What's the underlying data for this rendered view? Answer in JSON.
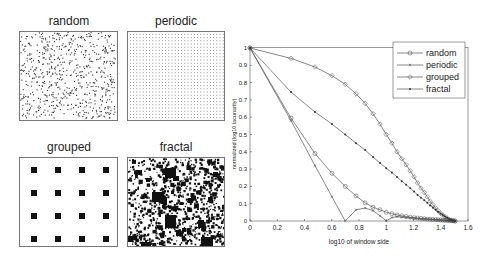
{
  "panels": [
    {
      "id": "random",
      "title": "random"
    },
    {
      "id": "periodic",
      "title": "periodic"
    },
    {
      "id": "grouped",
      "title": "grouped"
    },
    {
      "id": "fractal",
      "title": "fractal"
    }
  ],
  "chart_data": {
    "type": "line",
    "title": "",
    "xlabel": "log10 of window side",
    "ylabel": "normalized (log10 lacunarity)",
    "xlim": [
      0,
      1.6
    ],
    "ylim": [
      0,
      1
    ],
    "xticks": [
      "0",
      "0.2",
      "0.4",
      "0.6",
      "0.8",
      "1",
      "1.2",
      "1.4",
      "1.6"
    ],
    "yticks": [
      "0",
      "0.1",
      "0.2",
      "0.3",
      "0.4",
      "0.5",
      "0.6",
      "0.7",
      "0.8",
      "0.9",
      "1"
    ],
    "grid": false,
    "legend_position": "upper right",
    "x": [
      0,
      0.301,
      0.477,
      0.602,
      0.699,
      0.778,
      0.845,
      0.903,
      0.954,
      1.0,
      1.041,
      1.079,
      1.114,
      1.146,
      1.176,
      1.204,
      1.23,
      1.255,
      1.279,
      1.301,
      1.322,
      1.342,
      1.362,
      1.38,
      1.398,
      1.415,
      1.431,
      1.447,
      1.462,
      1.477,
      1.491,
      1.505
    ],
    "series": [
      {
        "name": "random",
        "marker": "circle",
        "values": [
          1,
          0.595,
          0.39,
          0.275,
          0.2,
          0.145,
          0.105,
          0.08,
          0.065,
          0.05,
          0.042,
          0.035,
          0.03,
          0.026,
          0.022,
          0.019,
          0.017,
          0.015,
          0.013,
          0.011,
          0.01,
          0.009,
          0.008,
          0.007,
          0.006,
          0.005,
          0.004,
          0.003,
          0.002,
          0.002,
          0.001,
          0
        ]
      },
      {
        "name": "periodic",
        "marker": "x",
        "values": [
          1,
          0.58,
          0.32,
          0.14,
          0,
          0.065,
          0.075,
          0.06,
          0.03,
          0,
          0.02,
          0.025,
          0.022,
          0.02,
          0.018,
          0.016,
          0.014,
          0.012,
          0.011,
          0.01,
          0.009,
          0.008,
          0.007,
          0.006,
          0.005,
          0.004,
          0.003,
          0.002,
          0.002,
          0.001,
          0.001,
          0
        ]
      },
      {
        "name": "grouped",
        "marker": "diamond",
        "values": [
          1,
          0.94,
          0.89,
          0.84,
          0.79,
          0.735,
          0.68,
          0.62,
          0.56,
          0.5,
          0.45,
          0.4,
          0.36,
          0.325,
          0.29,
          0.255,
          0.22,
          0.19,
          0.165,
          0.14,
          0.115,
          0.095,
          0.075,
          0.06,
          0.045,
          0.035,
          0.025,
          0.017,
          0.01,
          0.005,
          0.002,
          0
        ]
      },
      {
        "name": "fractal",
        "marker": "star",
        "values": [
          1,
          0.745,
          0.63,
          0.56,
          0.5,
          0.45,
          0.41,
          0.37,
          0.335,
          0.305,
          0.28,
          0.255,
          0.23,
          0.21,
          0.19,
          0.17,
          0.15,
          0.135,
          0.12,
          0.105,
          0.09,
          0.077,
          0.065,
          0.053,
          0.043,
          0.034,
          0.026,
          0.019,
          0.012,
          0.007,
          0.003,
          0
        ]
      }
    ]
  }
}
